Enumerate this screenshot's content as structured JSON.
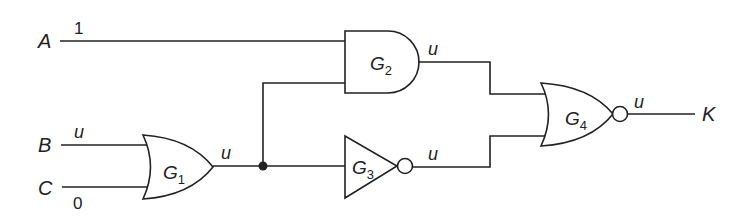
{
  "diagram": {
    "type": "logic-circuit",
    "inputs": [
      {
        "name": "A",
        "value": "1"
      },
      {
        "name": "B",
        "value": "u"
      },
      {
        "name": "C",
        "value": "0"
      }
    ],
    "gates": [
      {
        "id": "G1",
        "letter": "G",
        "sub": "1",
        "type": "OR",
        "inputs": [
          "B",
          "C"
        ],
        "output_value": "u"
      },
      {
        "id": "G2",
        "letter": "G",
        "sub": "2",
        "type": "AND",
        "inputs": [
          "A",
          "G1"
        ],
        "output_value": "u"
      },
      {
        "id": "G3",
        "letter": "G",
        "sub": "3",
        "type": "NOT",
        "inputs": [
          "G1"
        ],
        "output_value": "u"
      },
      {
        "id": "G4",
        "letter": "G",
        "sub": "4",
        "type": "NOR",
        "inputs": [
          "G2",
          "G3"
        ],
        "output_value": "u"
      }
    ],
    "output": {
      "name": "K"
    },
    "colors": {
      "line": "#222222",
      "background": "#ffffff"
    }
  }
}
